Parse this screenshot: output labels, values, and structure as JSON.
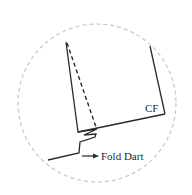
{
  "diagram": {
    "type": "sewing-pattern-detail",
    "labels": {
      "center_front": "CF",
      "fold_dart": "Fold Dart"
    },
    "colors": {
      "line": "#2a2a2a",
      "circle": "#c8c8c8",
      "background": "#ffffff"
    }
  }
}
